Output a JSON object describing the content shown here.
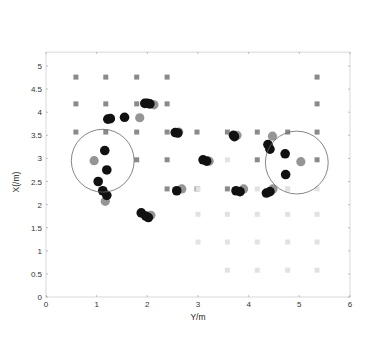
{
  "chart_data": [
    {
      "type": "scatter",
      "role": "main",
      "title": "",
      "xlabel": "Y/m",
      "ylabel": "X(/m)",
      "xlim": [
        0,
        6
      ],
      "ylim": [
        0,
        5.3
      ],
      "xticks": [
        "0",
        "1",
        "2",
        "3",
        "4",
        "5",
        "6"
      ],
      "yticks": [
        "0",
        "0.5",
        "1",
        "1.5",
        "2",
        "2.5",
        "3",
        "3.5",
        "4",
        "4.5",
        "5"
      ],
      "grid": false,
      "series": [
        {
          "name": "reference-grid-dark",
          "marker": "square",
          "color": "#8a8a8a",
          "points": [
            [
              0.59,
              4.76
            ],
            [
              1.18,
              4.76
            ],
            [
              1.79,
              4.76
            ],
            [
              2.39,
              4.76
            ],
            [
              5.35,
              4.76
            ],
            [
              0.59,
              4.18
            ],
            [
              1.18,
              4.18
            ],
            [
              1.79,
              4.18
            ],
            [
              2.39,
              4.18
            ],
            [
              5.35,
              4.18
            ],
            [
              0.59,
              3.57
            ],
            [
              1.18,
              3.57
            ],
            [
              1.79,
              3.57
            ],
            [
              2.39,
              3.57
            ],
            [
              2.98,
              3.57
            ],
            [
              3.58,
              3.57
            ],
            [
              4.17,
              3.57
            ],
            [
              4.77,
              3.57
            ],
            [
              5.35,
              3.57
            ],
            [
              1.79,
              2.97
            ],
            [
              2.39,
              2.97
            ],
            [
              4.17,
              2.97
            ],
            [
              5.35,
              2.97
            ],
            [
              2.39,
              2.34
            ],
            [
              2.98,
              2.34
            ],
            [
              3.58,
              2.34
            ]
          ]
        },
        {
          "name": "reference-grid-light",
          "marker": "square",
          "color": "#e2e2e2",
          "points": [
            [
              3.0,
              1.79
            ],
            [
              3.58,
              1.79
            ],
            [
              4.17,
              1.79
            ],
            [
              4.77,
              1.79
            ],
            [
              5.35,
              1.79
            ],
            [
              3.0,
              1.19
            ],
            [
              3.58,
              1.19
            ],
            [
              4.17,
              1.19
            ],
            [
              4.77,
              1.19
            ],
            [
              5.35,
              1.19
            ],
            [
              3.58,
              0.58
            ],
            [
              4.17,
              0.58
            ],
            [
              4.77,
              0.58
            ],
            [
              5.35,
              0.58
            ],
            [
              3.0,
              2.34
            ],
            [
              4.17,
              2.34
            ],
            [
              4.77,
              2.34
            ],
            [
              5.35,
              2.34
            ],
            [
              3.58,
              2.97
            ],
            [
              4.77,
              2.34
            ]
          ]
        },
        {
          "name": "true-position",
          "marker": "circle",
          "color": "#8f8f8f",
          "points": [
            [
              0.95,
              2.95
            ],
            [
              1.17,
              2.07
            ],
            [
              1.85,
              3.88
            ],
            [
              2.13,
              4.16
            ],
            [
              2.07,
              1.77
            ],
            [
              2.62,
              3.57
            ],
            [
              2.68,
              2.34
            ],
            [
              3.22,
              2.94
            ],
            [
              3.77,
              3.5
            ],
            [
              3.9,
              2.34
            ],
            [
              4.47,
              3.48
            ],
            [
              4.48,
              2.34
            ],
            [
              5.03,
              2.93
            ],
            [
              0.0,
              0.0
            ]
          ]
        },
        {
          "name": "estimated-position",
          "marker": "circle",
          "color": "#111111",
          "points": [
            [
              1.16,
              3.17
            ],
            [
              1.2,
              2.75
            ],
            [
              1.03,
              2.5
            ],
            [
              1.12,
              2.3
            ],
            [
              1.2,
              2.2
            ],
            [
              1.22,
              3.85
            ],
            [
              1.27,
              3.86
            ],
            [
              1.55,
              3.89
            ],
            [
              1.95,
              4.19
            ],
            [
              2.0,
              4.19
            ],
            [
              2.05,
              4.18
            ],
            [
              1.88,
              1.82
            ],
            [
              1.97,
              1.75
            ],
            [
              2.02,
              1.72
            ],
            [
              2.55,
              3.56
            ],
            [
              2.6,
              3.55
            ],
            [
              2.58,
              2.3
            ],
            [
              3.1,
              2.97
            ],
            [
              3.17,
              2.94
            ],
            [
              3.7,
              3.5
            ],
            [
              3.72,
              3.47
            ],
            [
              3.75,
              2.3
            ],
            [
              3.83,
              2.28
            ],
            [
              4.38,
              3.3
            ],
            [
              4.42,
              3.2
            ],
            [
              4.35,
              2.25
            ],
            [
              4.42,
              2.28
            ],
            [
              4.72,
              3.1
            ],
            [
              4.73,
              2.65
            ]
          ]
        }
      ],
      "annotations": [
        {
          "type": "circle",
          "center": [
            1.12,
            2.95
          ],
          "radius_m": 0.62
        },
        {
          "type": "circle",
          "center": [
            4.95,
            2.91
          ],
          "radius_m": 0.62
        },
        {
          "type": "box",
          "around": [
            2.0,
            4.18
          ],
          "note": "region magnified in inset"
        }
      ]
    },
    {
      "type": "scatter",
      "role": "inset",
      "xlim": [
        1.85,
        2.1
      ],
      "ylim": [
        4.135,
        4.225
      ],
      "xticks": [
        "1.85",
        "1.9",
        "1.95",
        "2",
        "2.05",
        "2.1"
      ],
      "yticks": [
        "4.14",
        "4.15",
        "4.16",
        "4.17",
        "4.18",
        "4.19",
        "4.2",
        "4.21",
        "4.22"
      ],
      "ylabel": "X(/m)",
      "series": [
        {
          "name": "estimated-position",
          "color": "#111111",
          "points": [
            [
              1.888,
              4.2
            ],
            [
              1.992,
              4.197
            ],
            [
              2.033,
              4.189
            ],
            [
              2.05,
              4.185
            ],
            [
              2.056,
              4.183
            ],
            [
              2.06,
              4.182
            ]
          ],
          "labels": [
            "1",
            "2",
            "3",
            "4",
            "5",
            "6"
          ]
        },
        {
          "name": "true-position",
          "color": "#8f8f8f",
          "points": [
            [
              2.075,
              4.155
            ]
          ]
        }
      ]
    }
  ]
}
